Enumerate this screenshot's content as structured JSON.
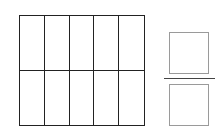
{
  "diagram": {
    "type": "fraction-area-model",
    "grid": {
      "rows": 2,
      "columns": 5,
      "total_cells": 10,
      "shaded_cells": [],
      "line_color": "#222222",
      "shade_color": "#9e9e9e"
    },
    "fraction": {
      "numerator": "",
      "denominator": "",
      "box_color": "#9a9a9a",
      "bar_color": "#444444"
    }
  }
}
